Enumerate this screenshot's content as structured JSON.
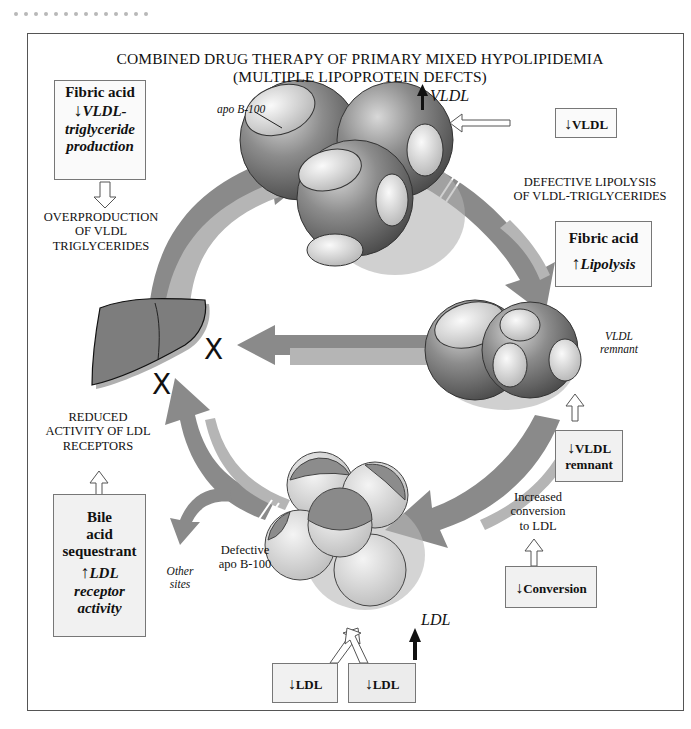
{
  "title_line1": "COMBINED DRUG THERAPY OF PRIMARY MIXED HYPOLIPIDEMIA",
  "title_line2": "(MULTIPLE LIPOPROTEIN DEFCTS)",
  "labels": {
    "apo_b100": "apo B-100",
    "vldl_up": "VLDL",
    "vldl_remnant_line1": "VLDL",
    "vldl_remnant_line2": "remnant",
    "overproduction": [
      "OVERPRODUCTION",
      "OF VLDL",
      "TRIGLYCERIDES"
    ],
    "defective_lipolysis": [
      "DEFECTIVE LIPOLYSIS",
      "OF VLDL-TRIGLYCERIDES"
    ],
    "reduced_activity": [
      "REDUCED",
      "ACTIVITY OF LDL",
      "RECEPTORS"
    ],
    "increased_conversion": [
      "Increased",
      "conversion",
      "to LDL"
    ],
    "defective_apo": [
      "Defective",
      "apo B-100"
    ],
    "other_sites": [
      "Other",
      "sites"
    ],
    "ldl_up": "LDL",
    "x_mark": "X"
  },
  "boxes": {
    "fibric_top": {
      "drug": "Fibric acid",
      "effect": [
        "VLDL-",
        "triglyceride",
        "production"
      ],
      "direction": "down"
    },
    "vldl_down": {
      "effect": "VLDL",
      "direction": "down"
    },
    "fibric_right": {
      "drug": "Fibric acid",
      "effect": "Lipolysis",
      "direction": "up"
    },
    "vldl_remnant_down": {
      "effect": [
        "VLDL",
        "remnant"
      ],
      "direction": "down"
    },
    "conversion_down": {
      "effect": "Conversion",
      "direction": "down"
    },
    "bile_acid": {
      "drug": [
        "Bile",
        "acid",
        "sequestrant"
      ],
      "effect": [
        "LDL",
        "receptor",
        "activity"
      ],
      "direction": "up"
    },
    "ldl_down_1": {
      "effect": "LDL",
      "direction": "down"
    },
    "ldl_down_2": {
      "effect": "LDL",
      "direction": "down"
    }
  },
  "glyphs": {
    "down_arrow": "↓",
    "up_arrow": "↑"
  },
  "colors": {
    "arrow_dark": "#8a8a8a",
    "arrow_light": "#b5b5b5",
    "sphere": "#7a7a7a",
    "liver": "#7d7d7d",
    "box_bg": "#f1f1f1"
  }
}
